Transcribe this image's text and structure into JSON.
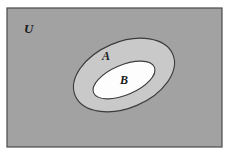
{
  "diagram": {
    "type": "venn-diagram",
    "universe": {
      "label": "U",
      "shape": "rectangle",
      "fill_color": "#a2a2a2",
      "border_color": "#4a4a4a",
      "x": 7,
      "y": 8,
      "width": 215,
      "height": 139,
      "label_x": 24,
      "label_y": 33
    },
    "sets": [
      {
        "name": "set-a",
        "label": "A",
        "shape": "ellipse",
        "fill_color": "#c9c9c9",
        "border_color": "#3c3c3c",
        "cx": 124,
        "cy": 75,
        "rx": 53,
        "ry": 33,
        "rotation": -23,
        "label_x": 106,
        "label_y": 60
      },
      {
        "name": "set-b",
        "label": "B",
        "shape": "ellipse",
        "fill_color": "#fdfdfd",
        "border_color": "#3c3c3c",
        "cx": 124,
        "cy": 80,
        "rx": 33,
        "ry": 15,
        "rotation": -23,
        "label_x": 124,
        "label_y": 84
      }
    ]
  }
}
